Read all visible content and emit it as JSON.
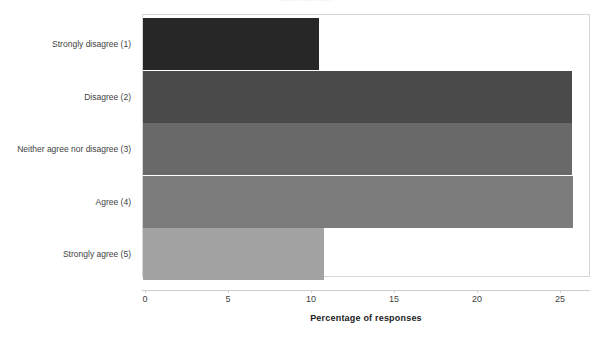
{
  "chart_data": {
    "type": "bar",
    "orientation": "horizontal",
    "title": "Satisfaction",
    "title_visible": false,
    "categories": [
      "Strongly disagree (1)",
      "Disagree (2)",
      "Neither agree nor disagree (3)",
      "Agree (4)",
      "Strongly agree (5)"
    ],
    "values": [
      10.5,
      25.7,
      25.7,
      25.8,
      10.8
    ],
    "xlabel": "Percentage of responses",
    "ylabel": "",
    "xlim": [
      0,
      27
    ],
    "ylim": null,
    "xticks": [
      "0",
      "5",
      "10",
      "15",
      "20",
      "25"
    ],
    "xtick_values": [
      0,
      5,
      10,
      15,
      20,
      25
    ],
    "grid": false,
    "legend": false,
    "legend_position": "none",
    "bar_colors": [
      "#272727",
      "#4a4a4a",
      "#696969",
      "#7c7c7c",
      "#a3a3a3"
    ],
    "frame_color": "#d6d6d6",
    "background": "#ffffff"
  }
}
